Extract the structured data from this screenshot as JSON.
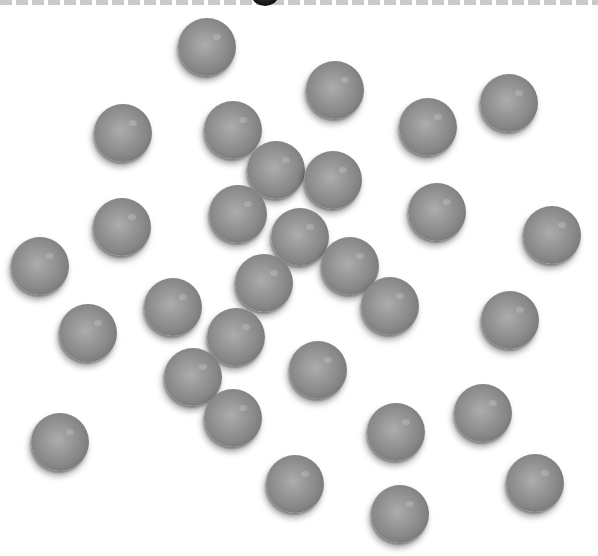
{
  "scene": {
    "description": "Scattered gray spheres on white background",
    "ball_count": 30,
    "ball_color": "#8a8a8a",
    "ball_diameter": 58,
    "border_color": "#c9c9c9"
  },
  "balls": [
    {
      "x": 207,
      "y": 47
    },
    {
      "x": 335,
      "y": 90
    },
    {
      "x": 123,
      "y": 133
    },
    {
      "x": 233,
      "y": 130
    },
    {
      "x": 428,
      "y": 127
    },
    {
      "x": 509,
      "y": 103
    },
    {
      "x": 276,
      "y": 170
    },
    {
      "x": 333,
      "y": 180
    },
    {
      "x": 122,
      "y": 227
    },
    {
      "x": 238,
      "y": 214
    },
    {
      "x": 437,
      "y": 212
    },
    {
      "x": 552,
      "y": 235
    },
    {
      "x": 300,
      "y": 237
    },
    {
      "x": 40,
      "y": 266
    },
    {
      "x": 350,
      "y": 266
    },
    {
      "x": 264,
      "y": 283
    },
    {
      "x": 173,
      "y": 307
    },
    {
      "x": 390,
      "y": 306
    },
    {
      "x": 88,
      "y": 333
    },
    {
      "x": 236,
      "y": 337
    },
    {
      "x": 510,
      "y": 320
    },
    {
      "x": 193,
      "y": 377
    },
    {
      "x": 318,
      "y": 370
    },
    {
      "x": 233,
      "y": 418
    },
    {
      "x": 60,
      "y": 442
    },
    {
      "x": 396,
      "y": 432
    },
    {
      "x": 483,
      "y": 413
    },
    {
      "x": 295,
      "y": 484
    },
    {
      "x": 535,
      "y": 483
    },
    {
      "x": 400,
      "y": 514
    }
  ]
}
